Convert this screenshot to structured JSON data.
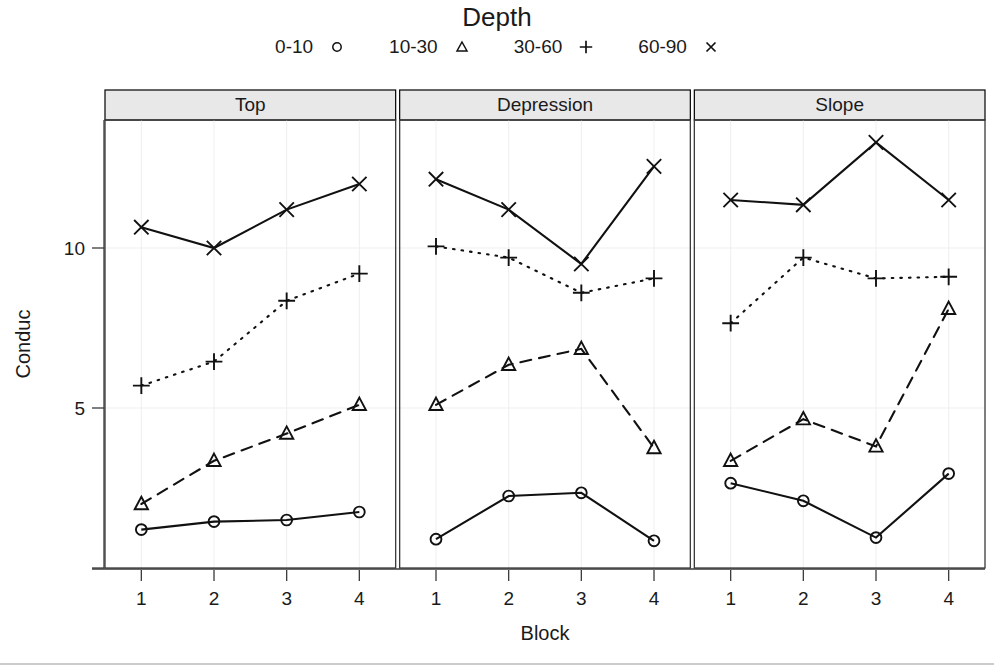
{
  "legend": {
    "title": "Depth",
    "entries": [
      {
        "label": "0-10",
        "symbol": "circle-icon"
      },
      {
        "label": "10-30",
        "symbol": "triangle-icon"
      },
      {
        "label": "30-60",
        "symbol": "plus-icon"
      },
      {
        "label": "60-90",
        "symbol": "cross-icon"
      }
    ]
  },
  "axes": {
    "xlabel": "Block",
    "ylabel": "Conduc",
    "xticks": [
      "1",
      "2",
      "3",
      "4"
    ],
    "yticks": [
      "5",
      "10"
    ]
  },
  "panels": [
    {
      "label": "Top"
    },
    {
      "label": "Depression"
    },
    {
      "label": "Slope"
    }
  ],
  "chart_data": {
    "type": "line",
    "title": "Depth",
    "xlabel": "Block",
    "ylabel": "Conduc",
    "x": [
      1,
      2,
      3,
      4
    ],
    "xlim": [
      0.5,
      4.5
    ],
    "ylim": [
      0.0,
      14.0
    ],
    "yticks": [
      5,
      10
    ],
    "xticks": [
      1,
      2,
      3,
      4
    ],
    "grid": true,
    "legend_title": "Depth",
    "legend_position": "top",
    "panel_variable": "Position",
    "panels": [
      {
        "name": "Top",
        "series": [
          {
            "name": "0-10",
            "marker": "circle",
            "linestyle": "solid",
            "values": [
              1.2,
              1.45,
              1.5,
              1.75
            ]
          },
          {
            "name": "10-30",
            "marker": "triangle",
            "linestyle": "dashed",
            "values": [
              2.0,
              3.35,
              4.2,
              5.1
            ]
          },
          {
            "name": "30-60",
            "marker": "plus",
            "linestyle": "dotted",
            "values": [
              5.7,
              6.45,
              8.35,
              9.2
            ]
          },
          {
            "name": "60-90",
            "marker": "cross",
            "linestyle": "solid",
            "values": [
              10.65,
              10.0,
              11.2,
              12.0
            ]
          }
        ]
      },
      {
        "name": "Depression",
        "series": [
          {
            "name": "0-10",
            "marker": "circle",
            "linestyle": "solid",
            "values": [
              0.9,
              2.25,
              2.35,
              0.85
            ]
          },
          {
            "name": "10-30",
            "marker": "triangle",
            "linestyle": "dashed",
            "values": [
              5.1,
              6.35,
              6.85,
              3.75
            ]
          },
          {
            "name": "30-60",
            "marker": "plus",
            "linestyle": "dotted",
            "values": [
              10.05,
              9.7,
              8.6,
              9.05
            ]
          },
          {
            "name": "60-90",
            "marker": "cross",
            "linestyle": "solid",
            "values": [
              12.15,
              11.2,
              9.5,
              12.55
            ]
          }
        ]
      },
      {
        "name": "Slope",
        "series": [
          {
            "name": "0-10",
            "marker": "circle",
            "linestyle": "solid",
            "values": [
              2.65,
              2.1,
              0.95,
              2.95
            ]
          },
          {
            "name": "10-30",
            "marker": "triangle",
            "linestyle": "dashed",
            "values": [
              3.35,
              4.65,
              3.8,
              8.1
            ]
          },
          {
            "name": "30-60",
            "marker": "plus",
            "linestyle": "dotted",
            "values": [
              7.65,
              9.7,
              9.05,
              9.1
            ]
          },
          {
            "name": "60-90",
            "marker": "cross",
            "linestyle": "solid",
            "values": [
              11.5,
              11.35,
              13.3,
              11.5
            ]
          }
        ]
      }
    ]
  },
  "colors": {
    "ink": "#111111",
    "strip_fill": "#e8e8e8",
    "grid": "#f0f0f0",
    "axis": "#3a3a3a"
  }
}
